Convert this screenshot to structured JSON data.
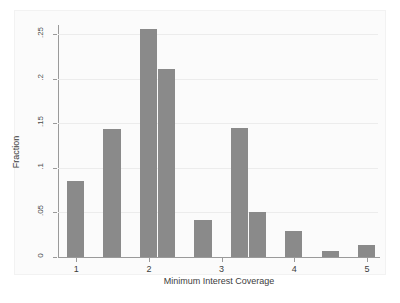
{
  "chart": {
    "type": "bar",
    "title": "",
    "xlabel": "Minimum Interest Coverage",
    "ylabel": "Fraction",
    "bar_color": "#8a8a8a",
    "grid_color": "#ececec",
    "axis_color": "#9a9a9a",
    "background": "#ffffff",
    "grid": "horizontal",
    "legend": "none"
  },
  "chart_data": {
    "type": "bar",
    "title": "",
    "xlabel": "Minimum Interest Coverage",
    "ylabel": "Fraction",
    "xlim": [
      0.75,
      5.15
    ],
    "ylim": [
      0,
      0.26
    ],
    "xticks": [
      1,
      2,
      3,
      4,
      5
    ],
    "xtick_labels": [
      "1",
      "2",
      "3",
      "4",
      "5"
    ],
    "yticks": [
      0,
      0.05,
      0.1,
      0.15,
      0.2,
      0.25
    ],
    "ytick_labels": [
      "0",
      ".05",
      ".1",
      ".15",
      ".2",
      ".25"
    ],
    "bin_width": 0.25,
    "categories": [
      0.875,
      1.125,
      1.375,
      1.625,
      1.875,
      2.125,
      2.375,
      2.625,
      2.875,
      3.125,
      3.375,
      3.625,
      3.875,
      4.125,
      4.375,
      4.625,
      4.875
    ],
    "bin_starts": [
      0.875,
      1.125,
      1.375,
      1.625,
      1.875,
      2.125,
      2.375,
      2.625,
      2.875,
      3.125,
      3.375,
      3.625,
      3.875,
      4.125,
      4.375,
      4.625,
      4.875
    ],
    "values": [
      0.085,
      0.0,
      0.143,
      0.0,
      0.256,
      0.211,
      0.0,
      0.042,
      0.0,
      0.145,
      0.051,
      0.0,
      0.029,
      0.0,
      0.007,
      0.0,
      0.013
    ],
    "bars": [
      {
        "x": 0.875,
        "value": 0.085
      },
      {
        "x": 1.375,
        "value": 0.143
      },
      {
        "x": 1.875,
        "value": 0.256
      },
      {
        "x": 2.125,
        "value": 0.211
      },
      {
        "x": 2.625,
        "value": 0.042
      },
      {
        "x": 3.125,
        "value": 0.145
      },
      {
        "x": 3.375,
        "value": 0.051
      },
      {
        "x": 3.875,
        "value": 0.029
      },
      {
        "x": 4.375,
        "value": 0.007
      },
      {
        "x": 4.875,
        "value": 0.013
      }
    ]
  }
}
